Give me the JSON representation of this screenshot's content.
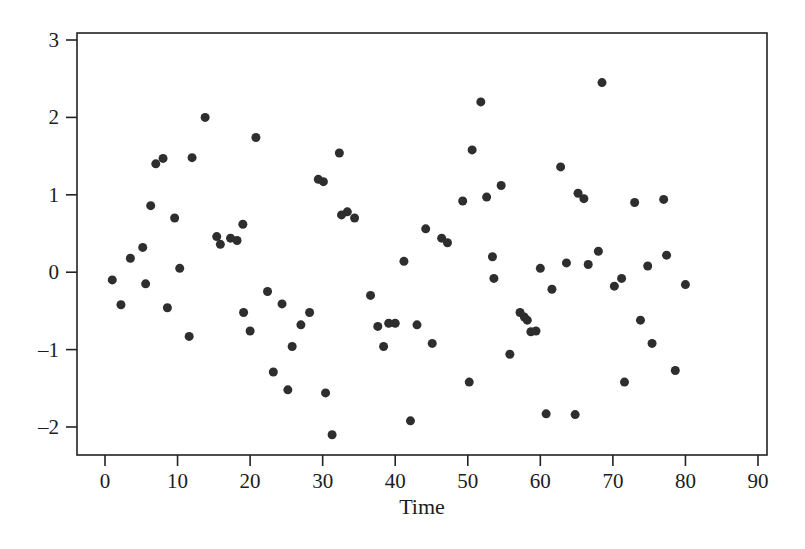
{
  "chart_data": {
    "type": "scatter",
    "title": "",
    "xlabel": "Time",
    "ylabel": "",
    "xlim": [
      0,
      90
    ],
    "ylim": [
      -2.2,
      3.0
    ],
    "grid": false,
    "legend": null,
    "marker": {
      "shape": "circle",
      "color": "#2e2e2e",
      "size_px": 9
    },
    "axis": {
      "frame": "box",
      "line_color": "#222222",
      "tick_direction": "out"
    },
    "xticks": [
      0,
      10,
      20,
      30,
      40,
      50,
      60,
      70,
      80,
      90
    ],
    "xtick_labels": [
      "0",
      "10",
      "20",
      "30",
      "40",
      "50",
      "60",
      "70",
      "80",
      "90"
    ],
    "yticks": [
      -2,
      -1,
      0,
      1,
      2,
      3
    ],
    "ytick_labels": [
      "–2",
      "–1",
      "0",
      "1",
      "2",
      "3"
    ],
    "points": [
      {
        "x": 1.0,
        "y": -0.1
      },
      {
        "x": 2.2,
        "y": -0.42
      },
      {
        "x": 3.5,
        "y": 0.18
      },
      {
        "x": 5.2,
        "y": 0.32
      },
      {
        "x": 5.6,
        "y": -0.15
      },
      {
        "x": 6.3,
        "y": 0.86
      },
      {
        "x": 7.0,
        "y": 1.4
      },
      {
        "x": 8.0,
        "y": 1.47
      },
      {
        "x": 8.6,
        "y": -0.46
      },
      {
        "x": 9.6,
        "y": 0.7
      },
      {
        "x": 10.3,
        "y": 0.05
      },
      {
        "x": 11.6,
        "y": -0.83
      },
      {
        "x": 12.0,
        "y": 1.48
      },
      {
        "x": 13.8,
        "y": 2.0
      },
      {
        "x": 15.4,
        "y": 0.46
      },
      {
        "x": 15.9,
        "y": 0.36
      },
      {
        "x": 17.3,
        "y": 0.44
      },
      {
        "x": 18.2,
        "y": 0.41
      },
      {
        "x": 19.0,
        "y": 0.62
      },
      {
        "x": 19.1,
        "y": -0.52
      },
      {
        "x": 20.0,
        "y": -0.76
      },
      {
        "x": 20.8,
        "y": 1.74
      },
      {
        "x": 22.4,
        "y": -0.25
      },
      {
        "x": 23.2,
        "y": -1.29
      },
      {
        "x": 24.4,
        "y": -0.41
      },
      {
        "x": 25.2,
        "y": -1.52
      },
      {
        "x": 25.8,
        "y": -0.96
      },
      {
        "x": 27.0,
        "y": -0.68
      },
      {
        "x": 28.2,
        "y": -0.52
      },
      {
        "x": 29.4,
        "y": 1.2
      },
      {
        "x": 30.1,
        "y": 1.17
      },
      {
        "x": 30.4,
        "y": -1.56
      },
      {
        "x": 31.3,
        "y": -2.1
      },
      {
        "x": 32.3,
        "y": 1.54
      },
      {
        "x": 32.6,
        "y": 0.74
      },
      {
        "x": 33.4,
        "y": 0.78
      },
      {
        "x": 34.4,
        "y": 0.7
      },
      {
        "x": 36.6,
        "y": -0.3
      },
      {
        "x": 37.6,
        "y": -0.7
      },
      {
        "x": 38.4,
        "y": -0.96
      },
      {
        "x": 39.1,
        "y": -0.66
      },
      {
        "x": 40.0,
        "y": -0.66
      },
      {
        "x": 41.2,
        "y": 0.14
      },
      {
        "x": 42.1,
        "y": -1.92
      },
      {
        "x": 43.0,
        "y": -0.68
      },
      {
        "x": 44.2,
        "y": 0.56
      },
      {
        "x": 45.1,
        "y": -0.92
      },
      {
        "x": 46.4,
        "y": 0.44
      },
      {
        "x": 47.2,
        "y": 0.38
      },
      {
        "x": 49.3,
        "y": 0.92
      },
      {
        "x": 50.2,
        "y": -1.42
      },
      {
        "x": 50.6,
        "y": 1.58
      },
      {
        "x": 51.8,
        "y": 2.2
      },
      {
        "x": 52.6,
        "y": 0.97
      },
      {
        "x": 53.4,
        "y": 0.2
      },
      {
        "x": 53.6,
        "y": -0.08
      },
      {
        "x": 54.6,
        "y": 1.12
      },
      {
        "x": 55.8,
        "y": -1.06
      },
      {
        "x": 57.2,
        "y": -0.52
      },
      {
        "x": 57.8,
        "y": -0.58
      },
      {
        "x": 58.2,
        "y": -0.62
      },
      {
        "x": 58.7,
        "y": -0.77
      },
      {
        "x": 59.4,
        "y": -0.76
      },
      {
        "x": 60.0,
        "y": 0.05
      },
      {
        "x": 60.8,
        "y": -1.83
      },
      {
        "x": 61.6,
        "y": -0.22
      },
      {
        "x": 62.8,
        "y": 1.36
      },
      {
        "x": 63.6,
        "y": 0.12
      },
      {
        "x": 64.8,
        "y": -1.84
      },
      {
        "x": 65.2,
        "y": 1.02
      },
      {
        "x": 66.0,
        "y": 0.95
      },
      {
        "x": 66.6,
        "y": 0.1
      },
      {
        "x": 68.0,
        "y": 0.27
      },
      {
        "x": 68.5,
        "y": 2.45
      },
      {
        "x": 70.2,
        "y": -0.18
      },
      {
        "x": 71.2,
        "y": -0.08
      },
      {
        "x": 71.6,
        "y": -1.42
      },
      {
        "x": 73.0,
        "y": 0.9
      },
      {
        "x": 73.8,
        "y": -0.62
      },
      {
        "x": 74.8,
        "y": 0.08
      },
      {
        "x": 75.4,
        "y": -0.92
      },
      {
        "x": 77.0,
        "y": 0.94
      },
      {
        "x": 77.4,
        "y": 0.22
      },
      {
        "x": 78.6,
        "y": -1.27
      },
      {
        "x": 80.0,
        "y": -0.16
      }
    ]
  },
  "figure": {
    "background_color": "#ffffff",
    "foreground_color": "#1c1c1c"
  }
}
